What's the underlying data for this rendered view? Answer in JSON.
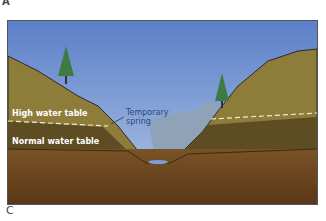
{
  "panel_labels": {
    "top": "A",
    "bottom": "C"
  },
  "diagram": {
    "labels": {
      "high_water_table": "High water table",
      "normal_water_table": "Normal water table",
      "temporary_spring_line1": "Temporary",
      "temporary_spring_line2": "spring"
    },
    "colors": {
      "sky_top": "#5b7fc8",
      "sky_bottom": "#a8bfe0",
      "hill": "#8a7a3a",
      "saturated": "#5a4a22",
      "bedrock": "#6a4520",
      "water": "#7b9fd0",
      "distant_hills": "#8fa3b8"
    }
  }
}
